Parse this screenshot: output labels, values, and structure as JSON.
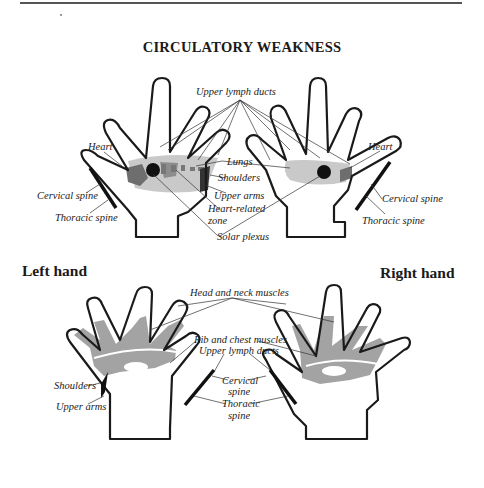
{
  "figure": {
    "title": "CIRCULATORY WEAKNESS",
    "colors": {
      "outline": "#1a1a1a",
      "light_shade": "#c4c4c4",
      "mid_shade": "#8a8a8a",
      "dark_shade": "#555555",
      "bottom_shade": "#a3a3a3"
    }
  },
  "top_pair": {
    "left_hand_labels": {
      "heart": "Heart",
      "cervical_spine": "Cervical spine",
      "thoracic_spine": "Thoracic spine"
    },
    "center_labels": {
      "upper_lymph_ducts": "Upper lymph ducts",
      "lungs": "Lungs",
      "shoulders": "Shoulders",
      "upper_arms": "Upper arms",
      "heart_related_zone_1": "Heart-related",
      "heart_related_zone_2": "zone",
      "solar_plexus": "Solar plexus"
    },
    "right_hand_labels": {
      "heart": "Heart",
      "cervical_spine": "Cervical spine",
      "thoracic_spine": "Thoracic spine"
    }
  },
  "section_labels": {
    "left_hand": "Left hand",
    "right_hand": "Right hand"
  },
  "bottom_pair": {
    "center_labels": {
      "head_neck_muscles": "Head and neck muscles",
      "rib_chest_muscles": "Rib and chest muscles",
      "upper_lymph_ducts": "Upper lymph ducts",
      "cervical_spine_1": "Cervical",
      "cervical_spine_2": "spine",
      "thoracic_spine_1": "Thoracic",
      "thoracic_spine_2": "spine"
    },
    "left_hand_labels": {
      "shoulders": "Shoulders",
      "upper_arms": "Upper arms"
    }
  }
}
